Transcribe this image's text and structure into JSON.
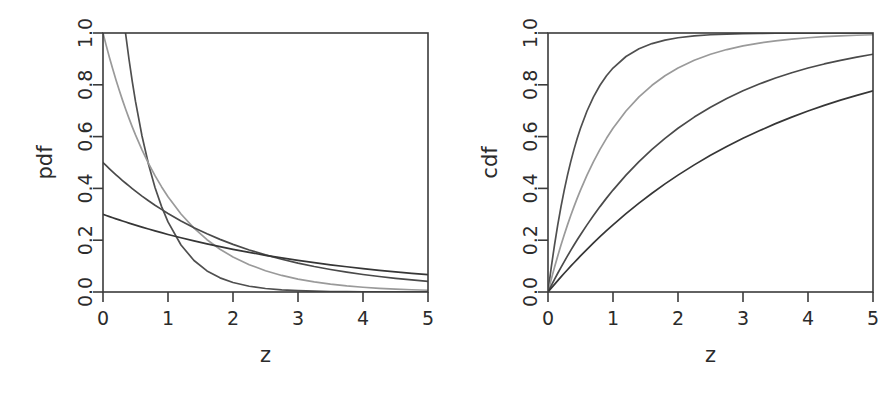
{
  "figure": {
    "background_color": "#ffffff",
    "panel_count": 2
  },
  "chart_data": [
    {
      "type": "line",
      "panel_id": "pdf",
      "title": "",
      "xlabel": "z",
      "ylabel": "pdf",
      "xlim": [
        0,
        5
      ],
      "ylim": [
        0.0,
        1.0
      ],
      "grid": false,
      "legend_position": "none",
      "xticks": [
        0,
        1,
        2,
        3,
        4,
        5
      ],
      "xtick_labels": [
        "0",
        "1",
        "2",
        "3",
        "4",
        "5"
      ],
      "yticks": [
        0.0,
        0.2,
        0.4,
        0.6,
        0.8,
        1.0
      ],
      "ytick_labels": [
        "0.0",
        "0.2",
        "0.4",
        "0.6",
        "0.8",
        "1.0"
      ],
      "x": [
        0,
        0.05,
        0.1,
        0.15,
        0.2,
        0.25,
        0.3,
        0.35,
        0.4,
        0.45,
        0.5,
        0.6,
        0.7,
        0.8,
        0.9,
        1.0,
        1.2,
        1.4,
        1.6,
        1.8,
        2.0,
        2.25,
        2.5,
        2.75,
        3.0,
        3.25,
        3.5,
        3.75,
        4.0,
        4.25,
        4.5,
        4.75,
        5.0
      ],
      "series": [
        {
          "name": "rate 2",
          "color": "#4f4f4f",
          "values": [
            2.0,
            1.8097,
            1.6375,
            1.4816,
            1.3406,
            1.2131,
            1.0976,
            0.9932,
            0.8987,
            0.8131,
            0.7358,
            0.6024,
            0.4932,
            0.4038,
            0.3306,
            0.2707,
            0.1815,
            0.1216,
            0.0815,
            0.0546,
            0.0366,
            0.0222,
            0.0135,
            0.0082,
            0.005,
            0.003,
            0.0018,
            0.0011,
            0.0007,
            0.0004,
            0.0002,
            0.0001,
            0.0001
          ]
        },
        {
          "name": "rate 1",
          "color": "#9a9a9a",
          "values": [
            1.0,
            0.9512,
            0.9048,
            0.8607,
            0.8187,
            0.7788,
            0.7408,
            0.7047,
            0.6703,
            0.6376,
            0.6065,
            0.5488,
            0.4966,
            0.4493,
            0.4066,
            0.3679,
            0.3012,
            0.2466,
            0.2019,
            0.1653,
            0.1353,
            0.1054,
            0.0821,
            0.0639,
            0.0498,
            0.0388,
            0.0302,
            0.0235,
            0.0183,
            0.0143,
            0.0111,
            0.0087,
            0.0067
          ]
        },
        {
          "name": "rate 0.5",
          "color": "#4a4a4a",
          "values": [
            0.5,
            0.4877,
            0.4756,
            0.4638,
            0.4524,
            0.4412,
            0.4304,
            0.4198,
            0.4094,
            0.3993,
            0.3894,
            0.3704,
            0.3523,
            0.3352,
            0.3189,
            0.3033,
            0.2744,
            0.2483,
            0.2247,
            0.2033,
            0.1839,
            0.1624,
            0.1433,
            0.1266,
            0.1116,
            0.0985,
            0.087,
            0.0768,
            0.0677,
            0.0598,
            0.0527,
            0.0465,
            0.041
          ]
        },
        {
          "name": "rate 0.3",
          "color": "#363636",
          "values": [
            0.3,
            0.2955,
            0.2911,
            0.2868,
            0.2825,
            0.2783,
            0.2742,
            0.2701,
            0.2661,
            0.2621,
            0.2582,
            0.2506,
            0.2432,
            0.236,
            0.229,
            0.2222,
            0.2093,
            0.1972,
            0.1857,
            0.1749,
            0.1647,
            0.1529,
            0.1417,
            0.1315,
            0.122,
            0.1132,
            0.105,
            0.0974,
            0.0904,
            0.0838,
            0.0778,
            0.0722,
            0.0669
          ]
        }
      ]
    },
    {
      "type": "line",
      "panel_id": "cdf",
      "title": "",
      "xlabel": "z",
      "ylabel": "cdf",
      "xlim": [
        0,
        5
      ],
      "ylim": [
        0.0,
        1.0
      ],
      "grid": false,
      "legend_position": "none",
      "xticks": [
        0,
        1,
        2,
        3,
        4,
        5
      ],
      "xtick_labels": [
        "0",
        "1",
        "2",
        "3",
        "4",
        "5"
      ],
      "yticks": [
        0.0,
        0.2,
        0.4,
        0.6,
        0.8,
        1.0
      ],
      "ytick_labels": [
        "0.0",
        "0.2",
        "0.4",
        "0.6",
        "0.8",
        "1.0"
      ],
      "x": [
        0,
        0.05,
        0.1,
        0.15,
        0.2,
        0.25,
        0.3,
        0.35,
        0.4,
        0.45,
        0.5,
        0.6,
        0.7,
        0.8,
        0.9,
        1.0,
        1.2,
        1.4,
        1.6,
        1.8,
        2.0,
        2.25,
        2.5,
        2.75,
        3.0,
        3.25,
        3.5,
        3.75,
        4.0,
        4.25,
        4.5,
        4.75,
        5.0
      ],
      "series": [
        {
          "name": "rate 2",
          "color": "#4f4f4f",
          "values": [
            0.0,
            0.0952,
            0.1813,
            0.2592,
            0.3297,
            0.3935,
            0.4512,
            0.5034,
            0.5507,
            0.5934,
            0.6321,
            0.6988,
            0.7534,
            0.7981,
            0.8347,
            0.8647,
            0.9093,
            0.9392,
            0.9592,
            0.9727,
            0.9817,
            0.9889,
            0.9933,
            0.9959,
            0.9975,
            0.9985,
            0.9991,
            0.9994,
            0.9997,
            0.9998,
            0.9999,
            0.9999,
            1.0
          ]
        },
        {
          "name": "rate 1",
          "color": "#9a9a9a",
          "values": [
            0.0,
            0.0488,
            0.0952,
            0.1393,
            0.1813,
            0.2212,
            0.2592,
            0.2953,
            0.3297,
            0.3624,
            0.3935,
            0.4512,
            0.5034,
            0.5507,
            0.5934,
            0.6321,
            0.6988,
            0.7534,
            0.7981,
            0.8347,
            0.8647,
            0.8946,
            0.9179,
            0.9361,
            0.9502,
            0.9612,
            0.9698,
            0.9765,
            0.9817,
            0.9857,
            0.9889,
            0.9913,
            0.9933
          ]
        },
        {
          "name": "rate 0.5",
          "color": "#4a4a4a",
          "values": [
            0.0,
            0.0247,
            0.0488,
            0.0723,
            0.0952,
            0.1175,
            0.1393,
            0.1605,
            0.1813,
            0.2015,
            0.2212,
            0.2592,
            0.2953,
            0.3297,
            0.3624,
            0.3935,
            0.4512,
            0.5034,
            0.5507,
            0.5934,
            0.6321,
            0.6753,
            0.7135,
            0.7473,
            0.7769,
            0.803,
            0.8262,
            0.8465,
            0.8647,
            0.8805,
            0.8946,
            0.907,
            0.9179
          ]
        },
        {
          "name": "rate 0.3",
          "color": "#363636",
          "values": [
            0.0,
            0.0149,
            0.0296,
            0.044,
            0.0582,
            0.0723,
            0.0861,
            0.0997,
            0.1131,
            0.1263,
            0.1393,
            0.1647,
            0.1894,
            0.2134,
            0.2366,
            0.2592,
            0.3023,
            0.343,
            0.3812,
            0.4173,
            0.4512,
            0.4909,
            0.5276,
            0.5616,
            0.5934,
            0.6224,
            0.6501,
            0.6752,
            0.6988,
            0.7204,
            0.7408,
            0.7594,
            0.7769
          ]
        }
      ]
    }
  ]
}
